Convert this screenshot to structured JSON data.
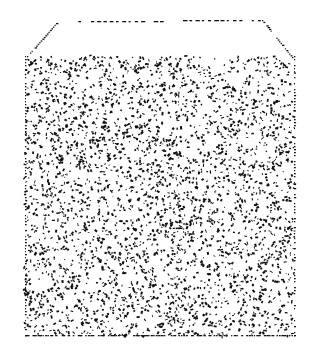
{
  "figure": {
    "width": 311,
    "height": 354,
    "background": "#ffffff",
    "ink_color": "#111111",
    "top_face": {
      "points": [
        [
          56,
          23
        ],
        [
          262,
          20
        ],
        [
          292,
          57
        ],
        [
          27,
          56
        ]
      ],
      "dashed_top_edge": {
        "x1": 72,
        "y1": 21,
        "x2": 258,
        "y2": 20,
        "gap_from": 160,
        "gap_to": 183
      }
    },
    "front_face": {
      "x": 25,
      "y": 56,
      "width": 269,
      "height": 279,
      "speckle_count": 3400,
      "speckle_seed": 7
    }
  }
}
